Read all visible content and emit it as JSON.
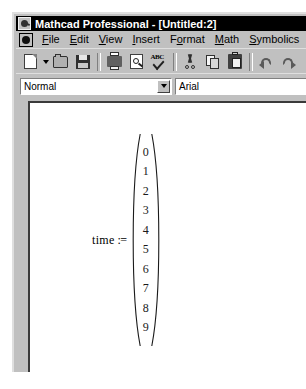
{
  "window": {
    "title": "Mathcad Professional - [Untitled:2]",
    "app_icon": "mathcad-logo-icon"
  },
  "menu": {
    "items": [
      {
        "label": "File",
        "mnemonic": "F"
      },
      {
        "label": "Edit",
        "mnemonic": "E"
      },
      {
        "label": "View",
        "mnemonic": "V"
      },
      {
        "label": "Insert",
        "mnemonic": "I"
      },
      {
        "label": "Format",
        "mnemonic": "o"
      },
      {
        "label": "Math",
        "mnemonic": "M"
      },
      {
        "label": "Symbolics",
        "mnemonic": "S"
      }
    ],
    "document_icon": "document-control-icon"
  },
  "toolbar": {
    "buttons": [
      {
        "name": "new-document-icon",
        "tooltip": "New"
      },
      {
        "name": "new-dropdown-arrow",
        "tooltip": "New template"
      },
      {
        "name": "open-folder-icon",
        "tooltip": "Open"
      },
      {
        "name": "save-floppy-icon",
        "tooltip": "Save"
      },
      {
        "name": "print-icon",
        "tooltip": "Print"
      },
      {
        "name": "print-preview-icon",
        "tooltip": "Print Preview"
      },
      {
        "name": "spell-check-icon",
        "tooltip": "Check Spelling"
      },
      {
        "name": "cut-scissors-icon",
        "tooltip": "Cut"
      },
      {
        "name": "copy-icon",
        "tooltip": "Copy"
      },
      {
        "name": "paste-clipboard-icon",
        "tooltip": "Paste"
      },
      {
        "name": "undo-icon",
        "tooltip": "Undo"
      },
      {
        "name": "redo-icon",
        "tooltip": "Redo"
      }
    ]
  },
  "format_bar": {
    "style": {
      "value": "Normal"
    },
    "font": {
      "value": "Arial"
    }
  },
  "document": {
    "math_region": {
      "variable": "time",
      "assignment_operator": ":=",
      "vector": [
        "0",
        "1",
        "2",
        "3",
        "4",
        "5",
        "6",
        "7",
        "8",
        "9"
      ]
    }
  },
  "colors": {
    "titlebar_bg": "#000000",
    "titlebar_text": "#ffffff",
    "chrome_bg": "#c0c0c0",
    "document_bg": "#ffffff",
    "text": "#000000"
  }
}
